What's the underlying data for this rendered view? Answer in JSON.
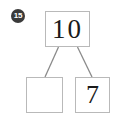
{
  "worksheet": {
    "problem_number": "15",
    "type": "number-bond"
  },
  "number_bond": {
    "whole": {
      "label": "10",
      "filled": true
    },
    "parts": [
      {
        "label": "",
        "filled": false
      },
      {
        "label": "7",
        "filled": true
      }
    ]
  },
  "colors": {
    "box_border": "#b9b9b9",
    "connector_line": "#8a8a8a",
    "badge_background": "#3a3a3a",
    "badge_text": "#ffffff",
    "digit_text": "#1a1a1a",
    "canvas_background": "#ffffff"
  }
}
